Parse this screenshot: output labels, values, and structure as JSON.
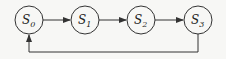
{
  "diagram": {
    "type": "state-cycle",
    "nodes": [
      {
        "id": "S0",
        "label": "S",
        "subscript": "0",
        "cx": 29,
        "cy": 20
      },
      {
        "id": "S1",
        "label": "S",
        "subscript": "1",
        "cx": 85,
        "cy": 20
      },
      {
        "id": "S2",
        "label": "S",
        "subscript": "2",
        "cx": 141,
        "cy": 20
      },
      {
        "id": "S3",
        "label": "S",
        "subscript": "3",
        "cx": 198,
        "cy": 20
      }
    ],
    "edges": [
      {
        "from": "S0",
        "to": "S1"
      },
      {
        "from": "S1",
        "to": "S2"
      },
      {
        "from": "S2",
        "to": "S3"
      },
      {
        "from": "S3",
        "to": "S0",
        "route": "feedback-below"
      }
    ],
    "colors": {
      "stroke": "#333333",
      "background": "#f7f7f5"
    }
  }
}
